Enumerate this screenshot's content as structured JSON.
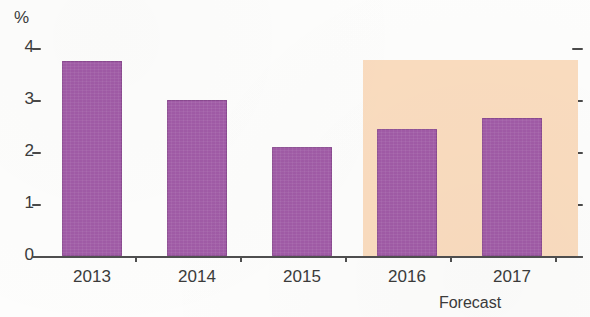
{
  "chart_data": {
    "type": "bar",
    "title": "",
    "subtitle": "",
    "xlabel": "",
    "ylabel": "%",
    "unit_label": "%",
    "categories": [
      "2013",
      "2014",
      "2015",
      "2016",
      "2017"
    ],
    "values": [
      3.75,
      3.0,
      2.1,
      2.45,
      2.65
    ],
    "series": [
      {
        "name": "",
        "values": [
          3.75,
          3.0,
          2.1,
          2.45,
          2.65
        ]
      }
    ],
    "ylim": [
      0,
      4
    ],
    "ytick_labels": [
      "4",
      "3",
      "2",
      "1",
      "0"
    ],
    "ytick_values": [
      4,
      3,
      2,
      1,
      0
    ],
    "grid": false,
    "legend": false,
    "legend_position": "none",
    "annotations": [
      {
        "text": "Forecast",
        "covers_categories": [
          "2016",
          "2017"
        ],
        "kind": "shaded-band-caption"
      }
    ],
    "forecast": {
      "caption": "Forecast",
      "start_category": "2016",
      "end_category": "2017",
      "band_color": "#fadcbf"
    },
    "colors": {
      "bar": "#a05ba6",
      "bar_border": "#7a3c7e",
      "forecast_band": "#fadcbf",
      "axis": "#4f4f4f",
      "text": "#3b3b3b",
      "background": "#fdfdfc"
    },
    "right_axis_ticks": [
      "",
      "",
      "",
      "",
      ""
    ]
  }
}
